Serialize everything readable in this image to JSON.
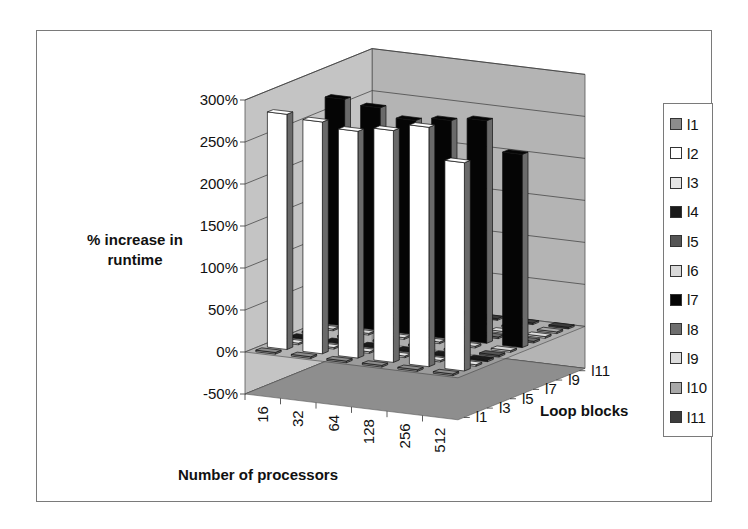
{
  "chart_data": {
    "type": "bar",
    "subtype": "3d-column",
    "title": "",
    "xlabel": "Number of processors",
    "ylabel": "% increase in runtime",
    "zlabel": "Loop blocks",
    "categories": [
      "16",
      "32",
      "64",
      "128",
      "256",
      "512"
    ],
    "depth_tick_labels": [
      "l1",
      "l3",
      "l5",
      "l7",
      "l9",
      "l11"
    ],
    "y_ticks": [
      "300%",
      "250%",
      "200%",
      "150%",
      "100%",
      "50%",
      "0%",
      "-50%"
    ],
    "ylim": [
      -50,
      300
    ],
    "grid": true,
    "legend_position": "right",
    "series": [
      {
        "name": "l1",
        "color": "#8c8c8c",
        "values": [
          2,
          2,
          2,
          2,
          2,
          2
        ]
      },
      {
        "name": "l2",
        "color": "#ffffff",
        "values": [
          280,
          276,
          270,
          276,
          285,
          248
        ]
      },
      {
        "name": "l3",
        "color": "#e6e6e6",
        "values": [
          2,
          2,
          2,
          2,
          2,
          2
        ]
      },
      {
        "name": "l4",
        "color": "#1a1a1a",
        "values": [
          2,
          2,
          2,
          2,
          2,
          2
        ]
      },
      {
        "name": "l5",
        "color": "#555555",
        "values": [
          2,
          2,
          2,
          2,
          2,
          2
        ]
      },
      {
        "name": "l6",
        "color": "#d9d9d9",
        "values": [
          2,
          2,
          2,
          2,
          2,
          2
        ]
      },
      {
        "name": "l7",
        "color": "#050505",
        "values": [
          270,
          265,
          255,
          260,
          265,
          230
        ]
      },
      {
        "name": "l8",
        "color": "#6e6e6e",
        "values": [
          2,
          2,
          2,
          2,
          2,
          2
        ]
      },
      {
        "name": "l9",
        "color": "#dcdcdc",
        "values": [
          2,
          2,
          2,
          2,
          2,
          2
        ]
      },
      {
        "name": "l10",
        "color": "#a8a8a8",
        "values": [
          2,
          2,
          2,
          2,
          2,
          2
        ]
      },
      {
        "name": "l11",
        "color": "#3c3c3c",
        "values": [
          2,
          2,
          2,
          2,
          2,
          2
        ]
      }
    ]
  },
  "axes": {
    "ylabel_line1": "% increase in",
    "ylabel_line2": "runtime",
    "xlabel": "Number of processors",
    "zlabel": "Loop blocks"
  },
  "colors": {
    "back_wall": "#b4b4b4",
    "side_wall": "#c4c4c4",
    "floor": "#8e8e8e",
    "floor_top": "#a8a8a8",
    "gridline": "#3a3a3a",
    "frame": "#7a7a7a"
  }
}
